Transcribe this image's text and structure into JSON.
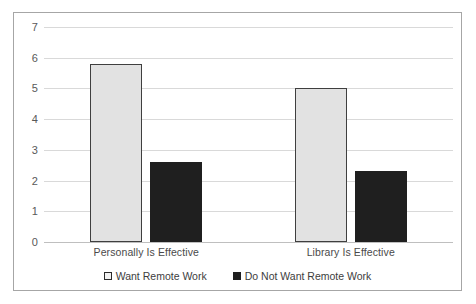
{
  "chart_data": {
    "type": "bar",
    "title": "",
    "subtitle": "",
    "xlabel": "",
    "ylabel": "",
    "ylim": [
      0,
      7
    ],
    "ytick_step": 1,
    "yticks": [
      "7",
      "6",
      "5",
      "4",
      "3",
      "2",
      "1",
      "0"
    ],
    "grid": true,
    "legend_position": "bottom-center",
    "categories": [
      "Personally Is Effective",
      "Library Is Effective"
    ],
    "series": [
      {
        "name": "Want Remote Work",
        "marker": "hollow-square",
        "color": "#E2E2E2",
        "border_color": "#3F3F3F",
        "values": [
          5.8,
          5.0
        ]
      },
      {
        "name": "Do Not Want Remote Work",
        "marker": "filled-square",
        "color": "#1F1F1F",
        "border_color": "#1F1F1F",
        "values": [
          2.6,
          2.3
        ]
      }
    ]
  },
  "frame": {
    "border_color": "#A6A6A6",
    "background": "#FFFFFF",
    "gridline_color": "#D9D9D9"
  }
}
